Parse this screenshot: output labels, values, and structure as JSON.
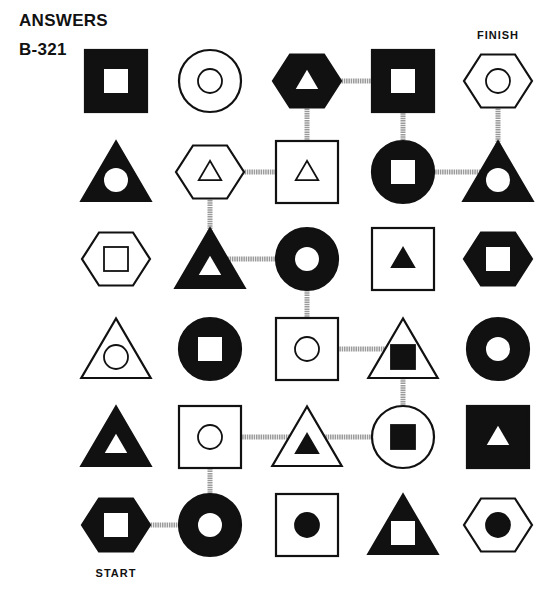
{
  "header": {
    "title": "ANSWERS",
    "puzzle_id": "B-321"
  },
  "labels": {
    "start": {
      "text": "START",
      "row": 5,
      "col": 0
    },
    "finish": {
      "text": "FINISH",
      "row": 0,
      "col": 4
    }
  },
  "grid": {
    "col_x": [
      116,
      210,
      307,
      403,
      498
    ],
    "row_y": [
      81,
      172,
      259,
      349,
      437,
      525
    ],
    "colors": {
      "ink": "#111111",
      "paper": "#ffffff",
      "path": "#9a9a9a"
    },
    "cells": [
      [
        {
          "outer": "square",
          "outer_fill": "black",
          "inner": "square",
          "inner_fill": "white"
        },
        {
          "outer": "circle",
          "outer_fill": "white",
          "inner": "circle",
          "inner_fill": "white"
        },
        {
          "outer": "hexagon",
          "outer_fill": "black",
          "inner": "triangle",
          "inner_fill": "white"
        },
        {
          "outer": "square",
          "outer_fill": "black",
          "inner": "square",
          "inner_fill": "white"
        },
        {
          "outer": "hexagon",
          "outer_fill": "white",
          "inner": "circle",
          "inner_fill": "white"
        }
      ],
      [
        {
          "outer": "triangle",
          "outer_fill": "black",
          "inner": "circle",
          "inner_fill": "white"
        },
        {
          "outer": "hexagon",
          "outer_fill": "white",
          "inner": "triangle",
          "inner_fill": "white"
        },
        {
          "outer": "square",
          "outer_fill": "white",
          "inner": "triangle",
          "inner_fill": "white"
        },
        {
          "outer": "circle",
          "outer_fill": "black",
          "inner": "square",
          "inner_fill": "white"
        },
        {
          "outer": "triangle",
          "outer_fill": "black",
          "inner": "circle",
          "inner_fill": "white"
        }
      ],
      [
        {
          "outer": "hexagon",
          "outer_fill": "white",
          "inner": "square",
          "inner_fill": "white"
        },
        {
          "outer": "triangle",
          "outer_fill": "black",
          "inner": "triangle",
          "inner_fill": "white"
        },
        {
          "outer": "circle",
          "outer_fill": "black",
          "inner": "circle",
          "inner_fill": "white"
        },
        {
          "outer": "square",
          "outer_fill": "white",
          "inner": "triangle",
          "inner_fill": "black"
        },
        {
          "outer": "hexagon",
          "outer_fill": "black",
          "inner": "square",
          "inner_fill": "white"
        }
      ],
      [
        {
          "outer": "triangle",
          "outer_fill": "white",
          "inner": "circle",
          "inner_fill": "white"
        },
        {
          "outer": "circle",
          "outer_fill": "black",
          "inner": "square",
          "inner_fill": "white"
        },
        {
          "outer": "square",
          "outer_fill": "white",
          "inner": "circle",
          "inner_fill": "white"
        },
        {
          "outer": "triangle",
          "outer_fill": "white",
          "inner": "square",
          "inner_fill": "black"
        },
        {
          "outer": "circle",
          "outer_fill": "black",
          "inner": "circle",
          "inner_fill": "white"
        }
      ],
      [
        {
          "outer": "triangle",
          "outer_fill": "black",
          "inner": "triangle",
          "inner_fill": "white"
        },
        {
          "outer": "square",
          "outer_fill": "white",
          "inner": "circle",
          "inner_fill": "white"
        },
        {
          "outer": "triangle",
          "outer_fill": "white",
          "inner": "triangle",
          "inner_fill": "black"
        },
        {
          "outer": "circle",
          "outer_fill": "white",
          "inner": "square",
          "inner_fill": "black"
        },
        {
          "outer": "square",
          "outer_fill": "black",
          "inner": "triangle",
          "inner_fill": "white"
        }
      ],
      [
        {
          "outer": "hexagon",
          "outer_fill": "black",
          "inner": "square",
          "inner_fill": "white"
        },
        {
          "outer": "circle",
          "outer_fill": "black",
          "inner": "circle",
          "inner_fill": "white"
        },
        {
          "outer": "square",
          "outer_fill": "white",
          "inner": "circle",
          "inner_fill": "black"
        },
        {
          "outer": "triangle",
          "outer_fill": "black",
          "inner": "square",
          "inner_fill": "white"
        },
        {
          "outer": "hexagon",
          "outer_fill": "white",
          "inner": "circle",
          "inner_fill": "black"
        }
      ]
    ]
  },
  "solution_path": [
    [
      5,
      0
    ],
    [
      5,
      1
    ],
    [
      4,
      1
    ],
    [
      4,
      2
    ],
    [
      4,
      3
    ],
    [
      3,
      3
    ],
    [
      3,
      2
    ],
    [
      2,
      2
    ],
    [
      2,
      1
    ],
    [
      1,
      1
    ],
    [
      1,
      2
    ],
    [
      0,
      2
    ],
    [
      0,
      3
    ],
    [
      1,
      3
    ],
    [
      1,
      4
    ],
    [
      0,
      4
    ]
  ]
}
